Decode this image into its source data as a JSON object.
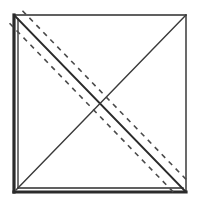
{
  "figure": {
    "canvas": {
      "width": 198,
      "height": 206,
      "background": "#ffffff"
    },
    "colors": {
      "stroke_dark": "#2b2b2b",
      "stroke_mid": "#3a3a3a",
      "stroke_dash": "#4a4a4a",
      "background": "#ffffff"
    },
    "square": {
      "name": "outer-square",
      "left": 14,
      "top": 15,
      "right": 186,
      "bottom": 192,
      "edges": [
        {
          "name": "top-edge",
          "style": "thin-solid",
          "width": 1.4
        },
        {
          "name": "right-edge",
          "style": "thin-solid",
          "width": 1.4
        },
        {
          "name": "bottom-edge",
          "style": "thick-double",
          "width": 3.2
        },
        {
          "name": "left-edge",
          "style": "thick-double",
          "width": 3.2
        }
      ],
      "inner_offset": 4
    },
    "diagonals": [
      {
        "name": "main-diagonal",
        "from": "top-left",
        "to": "bottom-right",
        "style": "solid",
        "width": 1.8
      },
      {
        "name": "anti-diagonal",
        "from": "bottom-left",
        "to": "top-right",
        "style": "solid",
        "width": 1.4
      }
    ],
    "dashed_lines": [
      {
        "name": "dashed-line-upper",
        "parallel_to": "main-diagonal",
        "offset": -9,
        "dash_pattern": "5 5",
        "width": 1.6
      },
      {
        "name": "dashed-line-lower",
        "parallel_to": "main-diagonal",
        "offset": 9,
        "dash_pattern": "5 5",
        "width": 1.6
      }
    ]
  }
}
